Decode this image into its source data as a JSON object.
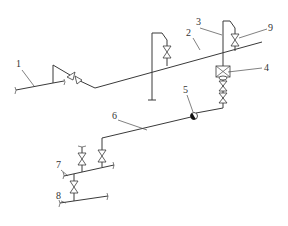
{
  "diagram": {
    "type": "pipeline-isometric-schematic",
    "colors": {
      "line": "#3a3a3a",
      "background": "#ffffff",
      "label": "#333333"
    },
    "labels": [
      {
        "id": "1",
        "text": "1",
        "x": 16,
        "y": 67
      },
      {
        "id": "2",
        "text": "2",
        "x": 188,
        "y": 36
      },
      {
        "id": "3",
        "text": "3",
        "x": 196,
        "y": 25
      },
      {
        "id": "4",
        "text": "4",
        "x": 264,
        "y": 70
      },
      {
        "id": "5",
        "text": "5",
        "x": 185,
        "y": 92
      },
      {
        "id": "6",
        "text": "6",
        "x": 114,
        "y": 118
      },
      {
        "id": "7",
        "text": "7",
        "x": 56,
        "y": 168
      },
      {
        "id": "8",
        "text": "8",
        "x": 56,
        "y": 199
      },
      {
        "id": "9",
        "text": "9",
        "x": 269,
        "y": 31
      }
    ],
    "components": [
      {
        "id": "1",
        "name": "inlet pipe"
      },
      {
        "id": "2",
        "name": "main pipe"
      },
      {
        "id": "3",
        "name": "vent riser"
      },
      {
        "id": "4",
        "name": "filter / meter box"
      },
      {
        "id": "5",
        "name": "check point"
      },
      {
        "id": "6",
        "name": "connecting pipe"
      },
      {
        "id": "7",
        "name": "branch pipe"
      },
      {
        "id": "8",
        "name": "outlet pipe"
      },
      {
        "id": "9",
        "name": "valve"
      }
    ]
  }
}
